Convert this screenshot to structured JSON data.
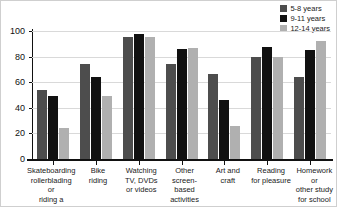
{
  "chart_data": {
    "type": "bar",
    "title": "",
    "subtitle": "",
    "xlabel": "",
    "ylabel": "",
    "ylim": [
      0,
      100
    ],
    "yticks": [
      0,
      20,
      40,
      60,
      80,
      100
    ],
    "grid": true,
    "legend_position": "top-right",
    "categories": [
      "Skateboarding\nrollerblading or\nriding a scooter",
      "Bike\nriding",
      "Watching\nTV, DVDs\nor videos",
      "Other\nscreen-based\nactivities",
      "Art and\ncraft",
      "Reading\nfor pleasure",
      "Homework or\nother study\nfor school"
    ],
    "category_lines": [
      [
        "Skateboarding",
        "rollerblading or",
        "riding a scooter"
      ],
      [
        "Bike",
        "riding"
      ],
      [
        "Watching",
        "TV, DVDs",
        "or videos"
      ],
      [
        "Other",
        "screen-based",
        "activities"
      ],
      [
        "Art and",
        "craft"
      ],
      [
        "Reading",
        "for pleasure"
      ],
      [
        "Homework or",
        "other study",
        "for school"
      ]
    ],
    "series": [
      {
        "name": "5-8 years",
        "color": "#4d4d4d",
        "values": [
          54,
          74,
          95.5,
          74.5,
          66.5,
          79.5,
          64
        ]
      },
      {
        "name": "9-11 years",
        "color": "#111111",
        "values": [
          49.5,
          64,
          97.5,
          86,
          46,
          87.5,
          85.5
        ]
      },
      {
        "name": "12-14 years",
        "color": "#b0b0b0",
        "values": [
          24.5,
          49.5,
          95.5,
          87,
          25.5,
          79.5,
          92.5
        ]
      }
    ]
  },
  "legend": {
    "items": [
      {
        "label": "5-8 years",
        "color": "#4d4d4d"
      },
      {
        "label": "9-11 years",
        "color": "#111111"
      },
      {
        "label": "12-14 years",
        "color": "#b0b0b0"
      }
    ]
  }
}
